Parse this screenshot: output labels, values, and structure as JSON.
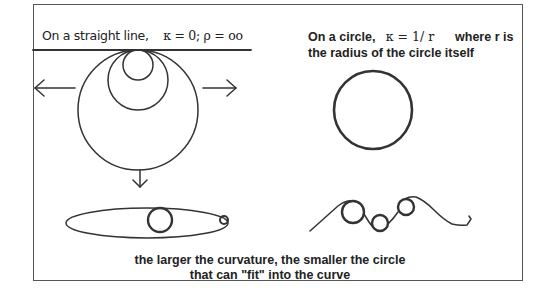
{
  "diagram": {
    "straight_line": {
      "text": "On a straight  line,",
      "formula": "κ = 0; ρ = oo"
    },
    "circle": {
      "line1_text": "On a circle,",
      "formula": "κ = 1/  r",
      "line1_suffix": "where r is",
      "line2": "the radius of the circle itself"
    },
    "conclusion": {
      "line1": "the larger the curvature, the smaller the circle",
      "line2": "that can \"fit\" into the curve"
    },
    "elements": [
      {
        "id": "tangent-line",
        "type": "line"
      },
      {
        "id": "nested-circles",
        "type": "circles",
        "count": 3
      },
      {
        "id": "arrow-left",
        "type": "arrow",
        "direction": "left"
      },
      {
        "id": "arrow-right",
        "type": "arrow",
        "direction": "right"
      },
      {
        "id": "arrow-down",
        "type": "arrow",
        "direction": "down"
      },
      {
        "id": "single-circle",
        "type": "circle"
      },
      {
        "id": "ellipse-with-circles",
        "type": "ellipse",
        "inner_circles": 2
      },
      {
        "id": "wavy-curve-with-circles",
        "type": "curve",
        "inner_circles": 3
      }
    ],
    "colors": {
      "stroke": "#333333",
      "frame": "#555555",
      "text": "#222222",
      "background": "#ffffff"
    }
  }
}
